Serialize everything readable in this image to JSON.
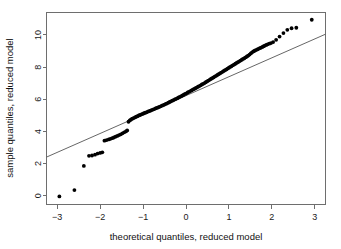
{
  "chart_data": {
    "type": "scatter",
    "title": "",
    "xlabel": "theoretical quantiles, reduced model",
    "ylabel": "sample quantiles, reduced model",
    "xlim": [
      -3.25,
      3.25
    ],
    "ylim": [
      -0.55,
      11.4
    ],
    "xticks": [
      -3,
      -2,
      -1,
      0,
      1,
      2,
      3
    ],
    "xtick_labels": [
      "−3",
      "−2",
      "−1",
      "0",
      "1",
      "2",
      "3"
    ],
    "yticks": [
      0,
      2,
      4,
      6,
      8,
      10
    ],
    "ytick_labels": [
      "0",
      "2",
      "4",
      "6",
      "8",
      "10"
    ],
    "grid": false,
    "legend": null,
    "reference_line": {
      "name": "qq-reference-line",
      "x": [
        -3.25,
        3.25
      ],
      "y": [
        2.4,
        10.05
      ],
      "slope": 1.177,
      "intercept": 6.225,
      "color": "#555555"
    },
    "series": [
      {
        "name": "sample quantiles",
        "marker": "filled-circle",
        "color": "#000000",
        "points": [
          [
            -2.95,
            -0.05
          ],
          [
            -2.6,
            0.35
          ],
          [
            -2.38,
            1.85
          ],
          [
            -2.26,
            2.48
          ],
          [
            -2.19,
            2.5
          ],
          [
            -2.12,
            2.55
          ],
          [
            -2.06,
            2.62
          ],
          [
            -2.0,
            2.66
          ],
          [
            -1.95,
            2.7
          ],
          [
            -1.9,
            3.42
          ],
          [
            -1.85,
            3.46
          ],
          [
            -1.8,
            3.5
          ],
          [
            -1.76,
            3.54
          ],
          [
            -1.72,
            3.58
          ],
          [
            -1.68,
            3.62
          ],
          [
            -1.64,
            3.67
          ],
          [
            -1.6,
            3.72
          ],
          [
            -1.56,
            3.77
          ],
          [
            -1.52,
            3.82
          ],
          [
            -1.48,
            3.88
          ],
          [
            -1.44,
            3.94
          ],
          [
            -1.4,
            4.0
          ],
          [
            -1.37,
            4.06
          ],
          [
            -1.34,
            4.6
          ],
          [
            -1.31,
            4.68
          ],
          [
            -1.28,
            4.74
          ],
          [
            -1.25,
            4.79
          ],
          [
            -1.22,
            4.83
          ],
          [
            -1.19,
            4.87
          ],
          [
            -1.16,
            4.91
          ],
          [
            -1.13,
            4.95
          ],
          [
            -1.1,
            4.99
          ],
          [
            -1.07,
            5.02
          ],
          [
            -1.04,
            5.06
          ],
          [
            -1.01,
            5.09
          ],
          [
            -0.98,
            5.13
          ],
          [
            -0.95,
            5.16
          ],
          [
            -0.92,
            5.19
          ],
          [
            -0.89,
            5.23
          ],
          [
            -0.86,
            5.26
          ],
          [
            -0.83,
            5.29
          ],
          [
            -0.8,
            5.33
          ],
          [
            -0.77,
            5.36
          ],
          [
            -0.74,
            5.39
          ],
          [
            -0.71,
            5.43
          ],
          [
            -0.68,
            5.46
          ],
          [
            -0.65,
            5.49
          ],
          [
            -0.62,
            5.53
          ],
          [
            -0.59,
            5.56
          ],
          [
            -0.56,
            5.6
          ],
          [
            -0.53,
            5.64
          ],
          [
            -0.5,
            5.67
          ],
          [
            -0.47,
            5.71
          ],
          [
            -0.44,
            5.75
          ],
          [
            -0.41,
            5.79
          ],
          [
            -0.38,
            5.83
          ],
          [
            -0.35,
            5.87
          ],
          [
            -0.32,
            5.91
          ],
          [
            -0.29,
            5.95
          ],
          [
            -0.26,
            5.99
          ],
          [
            -0.23,
            6.03
          ],
          [
            -0.2,
            6.07
          ],
          [
            -0.17,
            6.11
          ],
          [
            -0.14,
            6.15
          ],
          [
            -0.11,
            6.19
          ],
          [
            -0.08,
            6.24
          ],
          [
            -0.05,
            6.28
          ],
          [
            -0.02,
            6.33
          ],
          [
            0.01,
            6.37
          ],
          [
            0.04,
            6.42
          ],
          [
            0.07,
            6.46
          ],
          [
            0.1,
            6.51
          ],
          [
            0.13,
            6.55
          ],
          [
            0.16,
            6.6
          ],
          [
            0.19,
            6.64
          ],
          [
            0.22,
            6.69
          ],
          [
            0.25,
            6.73
          ],
          [
            0.28,
            6.78
          ],
          [
            0.31,
            6.82
          ],
          [
            0.34,
            6.87
          ],
          [
            0.37,
            6.92
          ],
          [
            0.4,
            6.96
          ],
          [
            0.43,
            7.01
          ],
          [
            0.46,
            7.06
          ],
          [
            0.49,
            7.11
          ],
          [
            0.52,
            7.16
          ],
          [
            0.55,
            7.21
          ],
          [
            0.58,
            7.26
          ],
          [
            0.61,
            7.31
          ],
          [
            0.64,
            7.36
          ],
          [
            0.67,
            7.41
          ],
          [
            0.7,
            7.46
          ],
          [
            0.73,
            7.51
          ],
          [
            0.76,
            7.56
          ],
          [
            0.79,
            7.61
          ],
          [
            0.82,
            7.66
          ],
          [
            0.85,
            7.71
          ],
          [
            0.88,
            7.76
          ],
          [
            0.91,
            7.81
          ],
          [
            0.94,
            7.86
          ],
          [
            0.97,
            7.91
          ],
          [
            1.0,
            7.96
          ],
          [
            1.03,
            8.01
          ],
          [
            1.06,
            8.06
          ],
          [
            1.09,
            8.11
          ],
          [
            1.12,
            8.16
          ],
          [
            1.15,
            8.21
          ],
          [
            1.18,
            8.26
          ],
          [
            1.21,
            8.31
          ],
          [
            1.24,
            8.36
          ],
          [
            1.27,
            8.41
          ],
          [
            1.3,
            8.46
          ],
          [
            1.33,
            8.51
          ],
          [
            1.36,
            8.56
          ],
          [
            1.39,
            8.61
          ],
          [
            1.42,
            8.66
          ],
          [
            1.45,
            8.72
          ],
          [
            1.48,
            8.78
          ],
          [
            1.51,
            8.85
          ],
          [
            1.54,
            8.92
          ],
          [
            1.57,
            8.98
          ],
          [
            1.6,
            9.02
          ],
          [
            1.63,
            9.06
          ],
          [
            1.66,
            9.1
          ],
          [
            1.69,
            9.14
          ],
          [
            1.72,
            9.18
          ],
          [
            1.75,
            9.22
          ],
          [
            1.78,
            9.26
          ],
          [
            1.81,
            9.3
          ],
          [
            1.84,
            9.34
          ],
          [
            1.87,
            9.38
          ],
          [
            1.9,
            9.42
          ],
          [
            1.94,
            9.46
          ],
          [
            1.98,
            9.5
          ],
          [
            2.03,
            9.56
          ],
          [
            2.1,
            9.7
          ],
          [
            2.18,
            9.9
          ],
          [
            2.27,
            10.12
          ],
          [
            2.36,
            10.32
          ],
          [
            2.46,
            10.42
          ],
          [
            2.57,
            10.45
          ],
          [
            2.93,
            10.95
          ]
        ]
      }
    ]
  }
}
